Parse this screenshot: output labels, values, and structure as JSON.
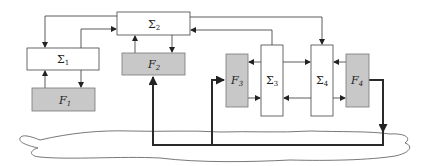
{
  "diagram": {
    "type": "block-diagram",
    "blocks": [
      {
        "id": "sigma2",
        "label": "Σ",
        "sub": "2",
        "kind": "system"
      },
      {
        "id": "sigma1",
        "label": "Σ",
        "sub": "1",
        "kind": "system"
      },
      {
        "id": "f1",
        "label": "F",
        "sub": "1",
        "kind": "filter"
      },
      {
        "id": "f2",
        "label": "F",
        "sub": "2",
        "kind": "filter"
      },
      {
        "id": "f3",
        "label": "F",
        "sub": "3",
        "kind": "filter"
      },
      {
        "id": "sigma3",
        "label": "Σ",
        "sub": "3",
        "kind": "system"
      },
      {
        "id": "sigma4",
        "label": "Σ",
        "sub": "4",
        "kind": "system"
      },
      {
        "id": "f4",
        "label": "F",
        "sub": "4",
        "kind": "filter"
      }
    ],
    "connections": [
      {
        "from": "sigma2",
        "to": "sigma1"
      },
      {
        "from": "sigma1",
        "to": "sigma2"
      },
      {
        "from": "f1",
        "to": "sigma1"
      },
      {
        "from": "sigma1",
        "to": "f1"
      },
      {
        "from": "f2",
        "to": "sigma2"
      },
      {
        "from": "sigma2",
        "to": "f2"
      },
      {
        "from": "sigma2",
        "to": "sigma4"
      },
      {
        "from": "sigma3",
        "to": "sigma2"
      },
      {
        "from": "sigma3",
        "to": "f3"
      },
      {
        "from": "f3",
        "to": "sigma3"
      },
      {
        "from": "sigma3",
        "to": "sigma4"
      },
      {
        "from": "sigma4",
        "to": "sigma3"
      },
      {
        "from": "f4",
        "to": "sigma4"
      },
      {
        "from": "sigma4",
        "to": "f4"
      },
      {
        "from": "f4",
        "to": "network",
        "style": "thick"
      },
      {
        "from": "network",
        "to": "f2",
        "style": "thick"
      },
      {
        "from": "network",
        "to": "f3",
        "style": "thick"
      }
    ],
    "colors": {
      "filter_fill": "#c8c8c8",
      "system_fill": "#ffffff",
      "stroke": "#333333"
    }
  }
}
